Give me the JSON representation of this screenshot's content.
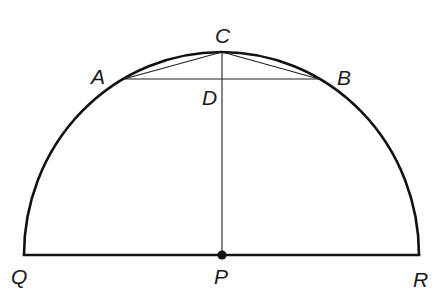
{
  "diagram": {
    "type": "semicircle-geometry",
    "points": {
      "Q": {
        "label": "Q",
        "x": 24,
        "y": 255
      },
      "P": {
        "label": "P",
        "x": 222,
        "y": 255
      },
      "R": {
        "label": "R",
        "x": 419,
        "y": 255
      },
      "C": {
        "label": "C",
        "x": 222,
        "y": 52
      },
      "A": {
        "label": "A",
        "x": 124,
        "y": 79
      },
      "B": {
        "label": "B",
        "x": 319,
        "y": 79
      },
      "D": {
        "label": "D",
        "x": 222,
        "y": 79
      }
    },
    "labels": {
      "Q": "Q",
      "P": "P",
      "R": "R",
      "C": "C",
      "A": "A",
      "B": "B",
      "D": "D"
    },
    "segments": [
      {
        "from": "Q",
        "to": "R",
        "weight": "thick",
        "name": "diameter-QR"
      },
      {
        "from": "P",
        "to": "C",
        "weight": "thin",
        "name": "radius-PC"
      },
      {
        "from": "A",
        "to": "B",
        "weight": "thin",
        "name": "chord-AB"
      },
      {
        "from": "C",
        "to": "A",
        "weight": "thin",
        "name": "segment-CA"
      },
      {
        "from": "C",
        "to": "B",
        "weight": "thin",
        "name": "segment-CB"
      }
    ],
    "arc": {
      "from": "Q",
      "to": "R",
      "through": "C",
      "name": "semicircle-arc"
    },
    "marked_points": [
      "P"
    ],
    "colors": {
      "stroke": "#111111",
      "background": "#ffffff"
    }
  }
}
